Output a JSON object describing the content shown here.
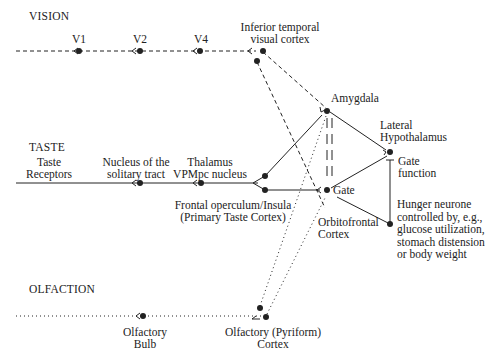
{
  "sections": {
    "vision": "VISION",
    "taste": "TASTE",
    "olfaction": "OLFACTION"
  },
  "nodes": {
    "v1": "V1",
    "v2": "V2",
    "v4": "V4",
    "inferior_temporal_line1": "Inferior temporal",
    "inferior_temporal_line2": "visual cortex",
    "amygdala": "Amygdala",
    "lateral_hypothalamus_line1": "Lateral",
    "lateral_hypothalamus_line2": "Hypothalamus",
    "gate_function_line1": "Gate",
    "gate_function_line2": "function",
    "taste_receptors_line1": "Taste",
    "taste_receptors_line2": "Receptors",
    "nucleus_solitary_line1": "Nucleus of the",
    "nucleus_solitary_line2": "solitary tract",
    "thalamus_line1": "Thalamus",
    "thalamus_line2": "VPMpc nucleus",
    "frontal_operculum_line1": "Frontal operculum/Insula",
    "frontal_operculum_line2": "(Primary Taste Cortex)",
    "gate": "Gate",
    "orbitofrontal_line1": "Orbitofrontal",
    "orbitofrontal_line2": "Cortex",
    "hunger_line1": "Hunger neurone",
    "hunger_line2": "controlled by, e.g.,",
    "hunger_line3": "glucose utilization,",
    "hunger_line4": "stomach distension",
    "hunger_line5": "or body weight",
    "olfactory_bulb_line1": "Olfactory",
    "olfactory_bulb_line2": "Bulb",
    "pyriform_line1": "Olfactory (Pyriform)",
    "pyriform_line2": "Cortex"
  },
  "colors": {
    "ink": "#222222",
    "background": "#ffffff"
  }
}
